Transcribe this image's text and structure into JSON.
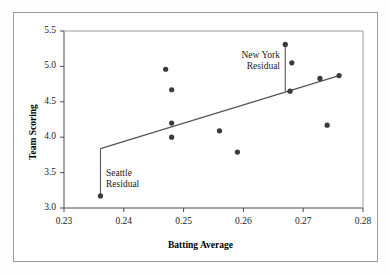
{
  "chart_data": {
    "type": "scatter",
    "title": "",
    "xlabel": "Batting Average",
    "ylabel": "Team Scoring",
    "xlim": [
      0.23,
      0.28
    ],
    "ylim": [
      3.0,
      5.5
    ],
    "xticks": [
      "0.23",
      "0.24",
      "0.25",
      "0.26",
      "0.27",
      "0.28"
    ],
    "yticks": [
      "3.0",
      "3.5",
      "4.0",
      "4.5",
      "5.0",
      "5.5"
    ],
    "grid": false,
    "legend": "none",
    "points": [
      {
        "x": 0.2361,
        "y": 3.17
      },
      {
        "x": 0.247,
        "y": 4.96
      },
      {
        "x": 0.248,
        "y": 4.67
      },
      {
        "x": 0.248,
        "y": 4.2
      },
      {
        "x": 0.248,
        "y": 4.0
      },
      {
        "x": 0.256,
        "y": 4.09
      },
      {
        "x": 0.259,
        "y": 3.79
      },
      {
        "x": 0.267,
        "y": 5.31
      },
      {
        "x": 0.2681,
        "y": 5.05
      },
      {
        "x": 0.2678,
        "y": 4.65
      },
      {
        "x": 0.2728,
        "y": 4.83
      },
      {
        "x": 0.274,
        "y": 4.17
      },
      {
        "x": 0.276,
        "y": 4.87
      }
    ],
    "fit_line": {
      "name": "least-squares regression line",
      "x0": 0.2361,
      "y0": 3.84,
      "x1": 0.276,
      "y1": 4.87
    },
    "residual_segments": [
      {
        "name": "Seattle Residual",
        "x": 0.2361,
        "y_point": 3.17,
        "y_line": 3.84
      },
      {
        "name": "New York Residual",
        "x": 0.267,
        "y_point": 5.31,
        "y_line": 4.65
      }
    ],
    "annotations": [
      {
        "name": "new-york-residual-label",
        "lines": [
          "New York",
          "Residual"
        ]
      },
      {
        "name": "seattle-residual-label",
        "lines": [
          "Seattle",
          "Residual"
        ]
      }
    ],
    "colors": {
      "point": "#3a3a3a",
      "line": "#555555",
      "axis": "#4a4a4a",
      "frame": "#9a9a9a",
      "text": "#1a1a1a",
      "background": "#ffffff"
    }
  }
}
